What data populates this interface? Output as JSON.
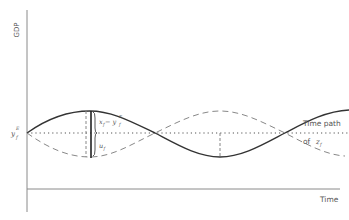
{
  "diagram": {
    "y_axis_label": "GDP",
    "x_axis_label": "Time",
    "potential_output_label": "y",
    "potential_output_sub": "f",
    "potential_output_sup": "E",
    "gap_label_x": "x",
    "gap_label_x_sub": "f",
    "gap_label_minus": " − y",
    "gap_label_y_sub": "f",
    "gap_label_sup": "E",
    "u_label": "u",
    "u_label_sub": "f",
    "time_path_line1": "Time path",
    "time_path_line2": "of",
    "time_path_var": "z",
    "time_path_var_sub": "f"
  },
  "colors": {
    "axis": "#888888",
    "solid_curve": "#333333",
    "dashed_curve": "#888888",
    "dotted_line": "#555555",
    "text": "#555555"
  }
}
